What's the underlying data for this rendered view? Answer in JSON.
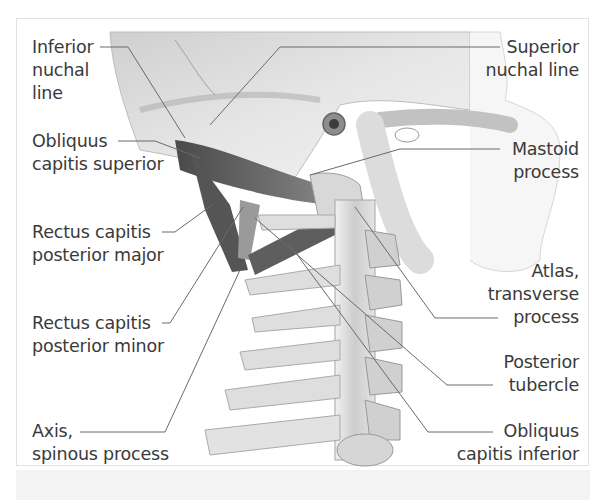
{
  "figure": {
    "colors": {
      "background": "#ffffff",
      "frame_border": "#e2e2e2",
      "bottom_band": "#f3f3f3",
      "label_text": "#3a3a3a",
      "leader_line": "#6a6a6a",
      "bone_light": "#e9e9e9",
      "bone_mid": "#c4c4c4",
      "muscle_dark": "#5a5a5a"
    }
  },
  "labels_left": [
    {
      "id": "inferior-nuchal-line",
      "text": "Inferior\nnuchal\nline"
    },
    {
      "id": "obliquus-capitis-superior",
      "text": "Obliquus\ncapitis superior"
    },
    {
      "id": "rectus-capitis-posterior-major",
      "text": "Rectus capitis\nposterior major"
    },
    {
      "id": "rectus-capitis-posterior-minor",
      "text": "Rectus capitis\nposterior minor"
    },
    {
      "id": "axis-spinous-process",
      "text": "Axis,\nspinous process"
    }
  ],
  "labels_right": [
    {
      "id": "superior-nuchal-line",
      "text": "Superior\nnuchal line"
    },
    {
      "id": "mastoid-process",
      "text": "Mastoid\nprocess"
    },
    {
      "id": "atlas-transverse-process",
      "text": "Atlas,\ntransverse\nprocess"
    },
    {
      "id": "posterior-tubercle",
      "text": "Posterior\ntubercle"
    },
    {
      "id": "obliquus-capitis-inferior",
      "text": "Obliquus\ncapitis inferior"
    }
  ]
}
